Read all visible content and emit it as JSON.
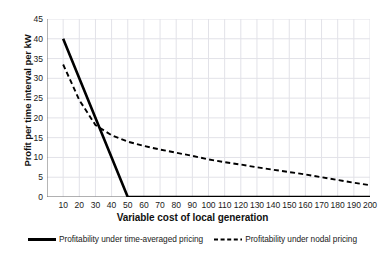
{
  "chart_data": {
    "type": "line",
    "title": "",
    "xlabel": "Variable cost of local generation",
    "ylabel": "Profit per time interval per kW",
    "xlim": [
      0,
      200
    ],
    "ylim": [
      0,
      45
    ],
    "xticks": [
      10,
      20,
      30,
      40,
      50,
      60,
      70,
      80,
      90,
      100,
      110,
      120,
      130,
      140,
      150,
      160,
      170,
      180,
      190,
      200
    ],
    "yticks": [
      0,
      5,
      10,
      15,
      20,
      25,
      30,
      35,
      40,
      45
    ],
    "grid": true,
    "legend_position": "bottom",
    "series": [
      {
        "name": "Profitability under time-averaged pricing",
        "style": "solid",
        "color": "#000000",
        "width": 2.6,
        "x": [
          10,
          50,
          200
        ],
        "values": [
          40,
          0,
          0
        ]
      },
      {
        "name": "Profitability under nodal pricing",
        "style": "dashed",
        "color": "#000000",
        "width": 1.9,
        "x": [
          10,
          20,
          30,
          40,
          50,
          60,
          70,
          80,
          90,
          100,
          110,
          120,
          130,
          140,
          150,
          160,
          170,
          180,
          190,
          200
        ],
        "values": [
          33.5,
          24.5,
          18.2,
          15.6,
          14.0,
          12.9,
          12.0,
          11.2,
          10.4,
          9.5,
          8.8,
          8.2,
          7.5,
          6.9,
          6.3,
          5.7,
          5.0,
          4.3,
          3.6,
          3.0
        ]
      }
    ]
  },
  "legend": {
    "items": [
      {
        "label": "Profitability under time-averaged pricing",
        "style": "solid"
      },
      {
        "label": "Profitability under nodal pricing",
        "style": "dashed"
      }
    ]
  },
  "colors": {
    "line": "#000000",
    "grid": "#e2e2e8",
    "axis": "#6e6e6e",
    "text": "#1a1a1a",
    "background": "#ffffff"
  }
}
